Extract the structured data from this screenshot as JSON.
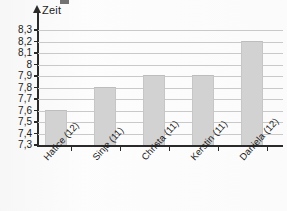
{
  "chart_data": {
    "type": "bar",
    "title": "",
    "xlabel": "",
    "ylabel": "Zeit",
    "categories": [
      "Hatice (12)",
      "Sinje (11)",
      "Christa (11)",
      "Kerstin (11)",
      "Daniela (12)"
    ],
    "values": [
      7.6,
      7.8,
      7.9,
      7.9,
      8.2
    ],
    "value_labels": [
      "7,6",
      "7,8",
      "7,9",
      "7,9",
      "8,2"
    ],
    "ylim": [
      7.3,
      8.3
    ],
    "ytick_labels": [
      "8,3",
      "8,2",
      "8,1",
      "8",
      "7,9",
      "7,8",
      "7,7",
      "7,6",
      "7,5",
      "7,4",
      "7,3"
    ],
    "ytick_values": [
      8.3,
      8.2,
      8.1,
      8.0,
      7.9,
      7.8,
      7.7,
      7.6,
      7.5,
      7.4,
      7.3
    ],
    "grid": true,
    "legend": false,
    "bar_color": "#d2d2d2",
    "axis_color": "#2a2a2a",
    "grid_color": "#c9c9c9"
  },
  "axis": {
    "y_title": "Zeit"
  }
}
